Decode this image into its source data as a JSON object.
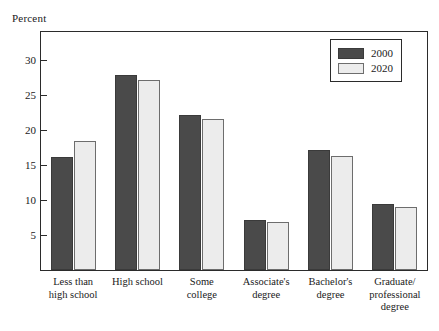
{
  "chart_data": {
    "type": "bar",
    "title": "",
    "xlabel": "",
    "ylabel": "Percent",
    "ylim": [
      0,
      34
    ],
    "yticks": [
      5,
      10,
      15,
      20,
      25,
      30
    ],
    "grid": false,
    "legend_position": "top-right",
    "categories": [
      "Less than\nhigh school",
      "High school",
      "Some\ncollege",
      "Associate's\ndegree",
      "Bachelor's\ndegree",
      "Graduate/\nprofessional\ndegree"
    ],
    "category_labels": [
      {
        "line1": "Less than",
        "line2": "high school",
        "line3": ""
      },
      {
        "line1": "High school",
        "line2": "",
        "line3": ""
      },
      {
        "line1": "Some",
        "line2": "college",
        "line3": ""
      },
      {
        "line1": "Associate's",
        "line2": "degree",
        "line3": ""
      },
      {
        "line1": "Bachelor's",
        "line2": "degree",
        "line3": ""
      },
      {
        "line1": "Graduate/",
        "line2": "professional",
        "line3": "degree"
      }
    ],
    "series": [
      {
        "name": "2000",
        "color": "#4a4a4a",
        "values": [
          16.1,
          27.8,
          22.2,
          7.1,
          17.2,
          9.4
        ]
      },
      {
        "name": "2020",
        "color": "#ececec",
        "values": [
          18.5,
          27.2,
          21.6,
          6.9,
          16.3,
          9.0
        ]
      }
    ]
  },
  "axis": {
    "y_title": "Percent",
    "tick_labels": [
      "30",
      "25",
      "20",
      "15",
      "10",
      "5"
    ]
  },
  "legend": {
    "entries": [
      {
        "label": "2000",
        "swatch": "dark-filled-swatch"
      },
      {
        "label": "2020",
        "swatch": "light-filled-swatch"
      }
    ]
  }
}
